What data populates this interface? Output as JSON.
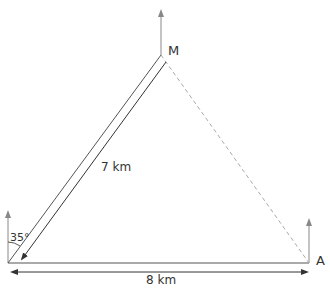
{
  "diagram": {
    "type": "vector-triangle",
    "vertices": {
      "origin": {
        "label": "",
        "x": 8,
        "y": 263
      },
      "M": {
        "label": "M",
        "x": 161,
        "y": 55
      },
      "A": {
        "label": "A",
        "x": 309,
        "y": 263
      }
    },
    "labels": {
      "angle": "35°",
      "side_om": "7 km",
      "side_oa": "8 km",
      "point_m": "M",
      "point_a": "A"
    },
    "edges": [
      {
        "from": "origin",
        "to": "M",
        "style": "solid",
        "length_label": "7 km"
      },
      {
        "from": "origin",
        "to": "A",
        "style": "solid",
        "length_label": "8 km"
      },
      {
        "from": "M",
        "to": "A",
        "style": "dashed"
      }
    ],
    "north_arrows": [
      "origin",
      "M",
      "A"
    ],
    "angle_from_north_deg": 35,
    "colors": {
      "line": "#555555",
      "dashed": "#aaaaaa",
      "north_arrow": "#888888",
      "text": "#333333"
    }
  }
}
